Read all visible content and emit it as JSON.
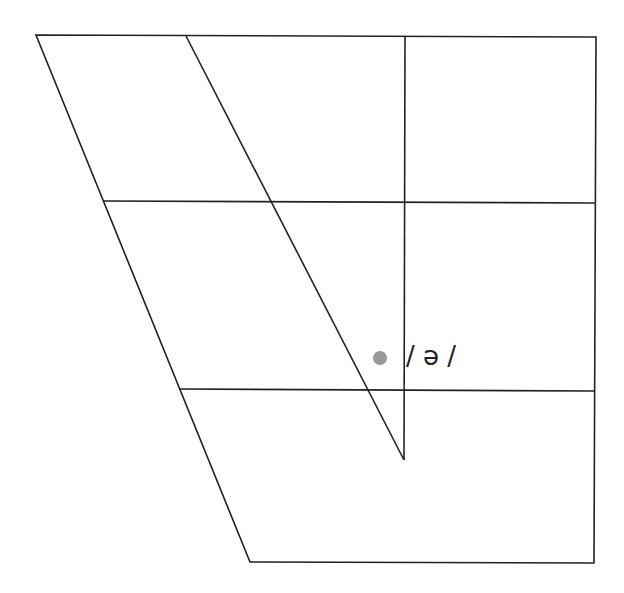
{
  "diagram": {
    "type": "vowel-chart",
    "line_color": "#222222",
    "outline": [
      [
        36,
        35
      ],
      [
        596,
        37
      ],
      [
        594,
        563
      ],
      [
        250,
        562
      ]
    ],
    "horizontal_lines": [
      {
        "from": [
          104,
          201
        ],
        "to": [
          596,
          203
        ]
      },
      {
        "from": [
          179,
          389
        ],
        "to": [
          594,
          391
        ]
      }
    ],
    "inner_lines": [
      {
        "from": [
          186,
          36
        ],
        "to": [
          404,
          460
        ]
      },
      {
        "from": [
          405,
          37
        ],
        "to": [
          404,
          460
        ]
      }
    ],
    "points": [
      {
        "symbol": "ə",
        "label": "/ ə /",
        "x": 380,
        "y": 358,
        "color": "#999999"
      }
    ]
  }
}
